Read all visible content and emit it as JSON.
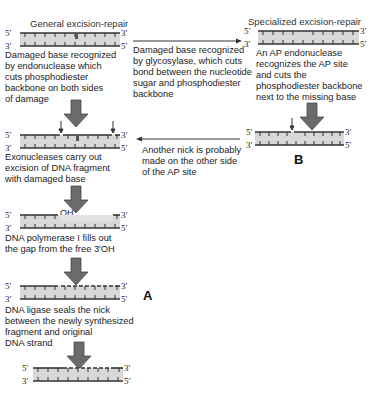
{
  "diagram": {
    "left_column": {
      "title": "General excision-repair",
      "steps": [
        {
          "caption_lines": [
            "Damaged base recognized",
            "by endonuclease which",
            "cuts phosphodiester",
            "backbone on both sides",
            "of damage"
          ]
        },
        {
          "caption_lines": [
            "Exonucleases carry out",
            "excision of DNA fragment",
            "with damaged base"
          ]
        },
        {
          "caption_lines": [
            "DNA polymerase I fills out",
            "the gap from the free 3′OH"
          ]
        },
        {
          "caption_lines": [
            "DNA ligase seals the nick",
            "between the newly synthesized",
            "fragment and original",
            "DNA strand"
          ]
        }
      ],
      "panel_label": "A",
      "oh_label": "OH"
    },
    "right_column": {
      "title": "Specialized excision-repair",
      "steps": [
        {
          "caption_lines": [
            "An AP endonuclease",
            "recognizes the AP site",
            "and cuts the",
            "phosphodiester backbone",
            "next to the missing base"
          ]
        }
      ],
      "panel_label": "B"
    },
    "middle": {
      "top_arrow_caption_lines": [
        "Damaged base recognized",
        "by glycosylase,  which cuts",
        "bond between the nucleotide",
        "sugar and phosphodiester",
        "backbone"
      ],
      "bottom_arrow_caption_lines": [
        "Another nick is probably",
        "made on the other side",
        "of the AP site"
      ]
    },
    "strand_ends": {
      "five_prime": "5′",
      "three_prime": "3′"
    },
    "colors": {
      "strand_line": "#333333",
      "duplex_fill": "#d4d4d4",
      "new_strand_fill": "#e6e6e6",
      "arrow_fill": "#6b6b6b",
      "arrow_stroke": "#4a4a4a"
    }
  }
}
